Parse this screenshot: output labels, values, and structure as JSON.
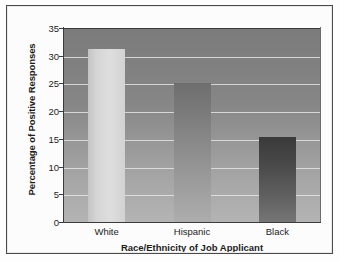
{
  "chart_data": {
    "type": "bar",
    "title": "",
    "categories": [
      "White",
      "Hispanic",
      "Black"
    ],
    "values": [
      31.2,
      25.0,
      15.3
    ],
    "xlabel": "Race/Ethnicity of Job Applicant",
    "ylabel": "Percentage of Positive Responses",
    "ylim": [
      0,
      35
    ],
    "ytick_labels": [
      "0",
      "5",
      "10",
      "15",
      "20",
      "25",
      "30",
      "35"
    ],
    "ytick_values": [
      0,
      5,
      10,
      15,
      20,
      25,
      30,
      35
    ],
    "grid": true,
    "legend": false,
    "legend_position": "none",
    "bar_styles": [
      "light-gray-gradient",
      "medium-gray-gradient",
      "dark-gray-gradient"
    ],
    "colors": {
      "plot_background_top": "#7b7b7b",
      "plot_background_bottom": "#b4b4b4",
      "gridline": "#e4e4e4",
      "axis": "#3b3b3b",
      "bar_white": "#dedede",
      "bar_hispanic": "#8a8a8a",
      "bar_black": "#474747",
      "text": "#1b1b1b",
      "frame_border": "#4a4a4a",
      "page_background": "#fdfdfd"
    }
  }
}
